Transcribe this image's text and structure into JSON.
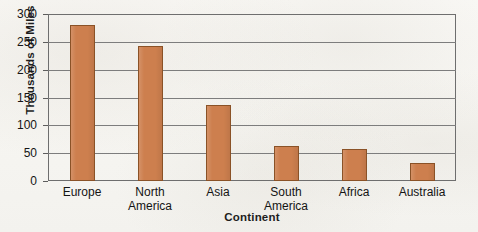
{
  "chart_data": {
    "type": "bar",
    "title": "",
    "xlabel": "Continent",
    "ylabel": "Thousands of Miles",
    "categories": [
      "Europe",
      "North America",
      "Asia",
      "South America",
      "Africa",
      "Australia"
    ],
    "values": [
      280,
      242,
      137,
      62,
      57,
      33
    ],
    "ylim": [
      0,
      300
    ],
    "yticks": [
      0,
      50,
      100,
      150,
      200,
      250,
      300
    ],
    "ytick_labels": [
      "0",
      "50",
      "100",
      "150",
      "200",
      "250",
      "300"
    ],
    "grid": true,
    "legend": false,
    "bar_color": "#cd7f4e",
    "bar_edge_color": "#8a5227",
    "grid_color": "#7d7d7d",
    "frame_color": "#6e6e6e",
    "background_color": "#f8f7f4"
  }
}
